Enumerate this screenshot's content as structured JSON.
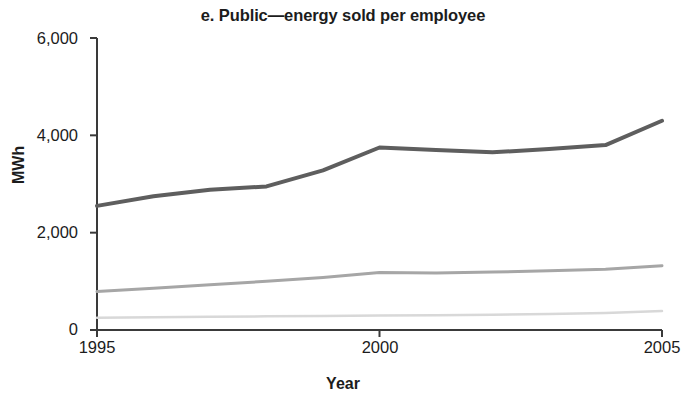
{
  "chart_data": {
    "type": "line",
    "title": "e. Public—energy sold per employee",
    "xlabel": "Year",
    "ylabel": "MWh",
    "x": [
      1995,
      1996,
      1997,
      1998,
      1999,
      2000,
      2001,
      2002,
      2003,
      2004,
      2005
    ],
    "xlim": [
      1995,
      2005
    ],
    "ylim": [
      0,
      6000
    ],
    "xticks": [
      1995,
      2000,
      2005
    ],
    "xtick_labels": [
      "1995",
      "2000",
      "2005"
    ],
    "yticks": [
      0,
      2000,
      4000,
      6000
    ],
    "ytick_labels": [
      "0",
      "2,000",
      "4,000",
      "6,000"
    ],
    "grid": false,
    "legend": "none",
    "series": [
      {
        "name": "dark-series",
        "color": "#5e5e5e",
        "width": 4,
        "values": [
          2550,
          2750,
          2880,
          2950,
          3280,
          3750,
          3700,
          3650,
          3720,
          3800,
          4300
        ]
      },
      {
        "name": "medium-series",
        "color": "#a6a6a6",
        "width": 3,
        "values": [
          790,
          860,
          930,
          1000,
          1080,
          1180,
          1170,
          1190,
          1220,
          1250,
          1320
        ]
      },
      {
        "name": "light-series",
        "color": "#d8d8d8",
        "width": 2.5,
        "values": [
          250,
          260,
          270,
          280,
          290,
          300,
          305,
          315,
          330,
          350,
          390
        ]
      }
    ]
  },
  "axes": {
    "axis_color": "#3a3a3a",
    "tick_length": 7
  }
}
